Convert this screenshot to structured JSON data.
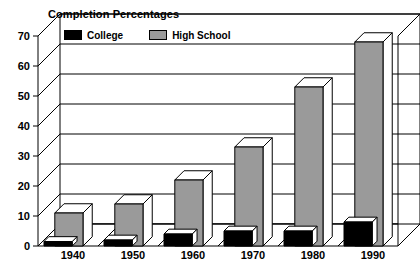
{
  "chart_data": {
    "type": "bar",
    "title": "Completion Percentages",
    "xlabel": "",
    "ylabel": "",
    "ylim": [
      0,
      70
    ],
    "ytick_step": 10,
    "yticks": [
      0,
      10,
      20,
      30,
      40,
      50,
      60,
      70
    ],
    "grid": true,
    "legend_position": "top-left-inside",
    "three_d": true,
    "categories": [
      "1940",
      "1950",
      "1960",
      "1970",
      "1980",
      "1990"
    ],
    "series": [
      {
        "name": "College",
        "color": "#000000",
        "values": [
          1.5,
          2,
          4,
          5,
          5,
          8
        ]
      },
      {
        "name": "High School",
        "color": "#9a9a9a",
        "values": [
          11,
          14,
          22,
          33,
          53,
          68
        ]
      }
    ]
  },
  "legend": {
    "entries": [
      {
        "label": "College"
      },
      {
        "label": "High School"
      }
    ]
  },
  "colors": {
    "college": "#000000",
    "high_school": "#9a9a9a",
    "bar_top": "#ffffff",
    "bar_side": "#ffffff",
    "outline": "#000000",
    "grid": "#000000",
    "background": "#ffffff"
  }
}
